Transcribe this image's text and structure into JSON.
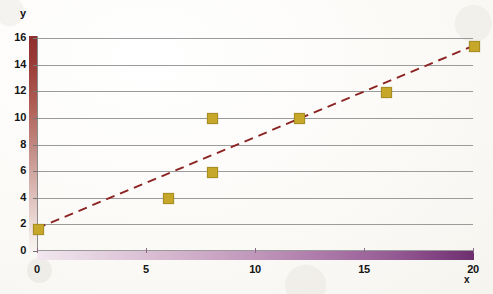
{
  "chart_data": {
    "type": "scatter",
    "title": "",
    "xlabel": "x",
    "ylabel": "y",
    "xlim": [
      0,
      20
    ],
    "ylim": [
      0,
      16
    ],
    "grid": true,
    "legend": "none",
    "x_ticks": [
      0,
      5,
      10,
      15,
      20
    ],
    "y_ticks": [
      0,
      2,
      4,
      6,
      8,
      10,
      12,
      14,
      16
    ],
    "x_tick_labels": [
      "0",
      "5",
      "10",
      "15",
      "20"
    ],
    "y_tick_labels": [
      "0",
      "2",
      "4",
      "6",
      "8",
      "10",
      "12",
      "14",
      "16"
    ],
    "gridlines_y": [
      0,
      2,
      4,
      6,
      8,
      10,
      12,
      14,
      16
    ],
    "series": [
      {
        "name": "data points",
        "marker": "square",
        "color": "#c7a72a",
        "points": [
          {
            "x": 0,
            "y": 1.7
          },
          {
            "x": 6,
            "y": 4
          },
          {
            "x": 8,
            "y": 6
          },
          {
            "x": 8,
            "y": 10
          },
          {
            "x": 12,
            "y": 10
          },
          {
            "x": 16,
            "y": 12
          },
          {
            "x": 20,
            "y": 15.4
          }
        ]
      }
    ],
    "trendline": {
      "name": "trend line",
      "style": "dashed",
      "color": "#8b2423",
      "x_start": 0,
      "y_start": 1.7,
      "x_end": 20,
      "y_end": 15.4
    },
    "axis_styles": {
      "y_axis_gradient_top": "#8e2f2f",
      "y_axis_gradient_bottom": "#f8f4f1",
      "x_axis_gradient_left": "#f2e7ee",
      "x_axis_gradient_right": "#6d2f6e",
      "gridline_color": "#9b9b9b",
      "background": "#fdfdfb"
    }
  }
}
